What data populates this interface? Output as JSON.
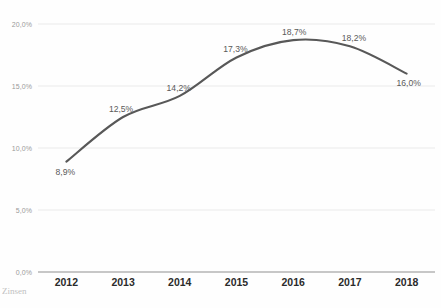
{
  "chart_data": {
    "type": "line",
    "title": "",
    "subtitle": "",
    "xlabel": "",
    "ylabel": "",
    "categories": [
      "2012",
      "2013",
      "2014",
      "2015",
      "2016",
      "2017",
      "2018"
    ],
    "values": [
      8.9,
      12.5,
      14.2,
      17.3,
      18.7,
      18.2,
      16.0
    ],
    "point_labels": [
      "8,9%",
      "12,5%",
      "14,2%",
      "17,3%",
      "18,7%",
      "18,2%",
      "16,0%"
    ],
    "series": [
      {
        "name": "",
        "values": [
          8.9,
          12.5,
          14.2,
          17.3,
          18.7,
          18.2,
          16.0
        ],
        "color": "#585858"
      }
    ],
    "ylim": [
      0,
      20
    ],
    "ytick_values": [
      0,
      5,
      10,
      15,
      20
    ],
    "ytick_labels": [
      "0,0%",
      "5,0%",
      "10,0%",
      "15,0%",
      "20,0%"
    ],
    "grid": true,
    "grid_axis": "y",
    "legend": false,
    "legend_position": "none",
    "line_style": "smooth",
    "markers": false,
    "decimal_separator": ","
  },
  "colors": {
    "line": "#585858",
    "gridline": "#e9e9e9",
    "axis": "#b5b5b5",
    "ytick_text": "#9a9a9a",
    "xtick_text": "#2b2b2b",
    "point_label_text": "#5a5a5a",
    "background": "#ffffff"
  },
  "caption": {
    "cut_text": "Zinsen",
    "bottom_text": ""
  }
}
